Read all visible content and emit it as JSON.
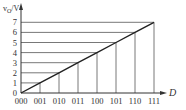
{
  "chart_data": {
    "type": "line",
    "title": "",
    "xlabel": "D",
    "ylabel": "vO/V",
    "ylabel_main": "v",
    "ylabel_sub": "O",
    "ylabel_unit": "/V",
    "categories": [
      "000",
      "001",
      "010",
      "011",
      "100",
      "101",
      "110",
      "111"
    ],
    "values": [
      0,
      1,
      2,
      3,
      4,
      5,
      6,
      7
    ],
    "y_ticks": [
      "0",
      "1",
      "2",
      "3",
      "4",
      "5",
      "6",
      "7"
    ],
    "ylim": [
      0,
      7
    ],
    "grid": "projection lines from each data point to both axes",
    "legend": null,
    "colors": {
      "line": "#222222",
      "grid": "#555555",
      "axis": "#333333"
    }
  }
}
